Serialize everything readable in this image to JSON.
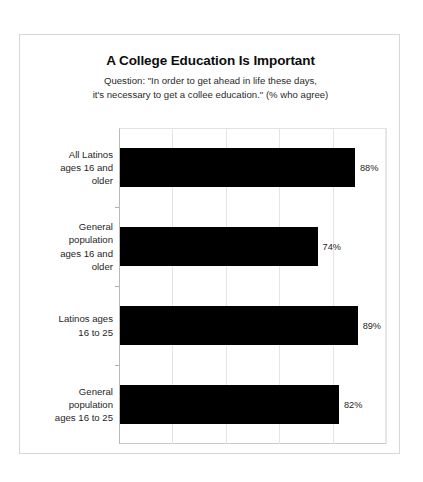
{
  "chart_data": {
    "type": "bar",
    "orientation": "horizontal",
    "title": "A College Education Is Important",
    "subtitle_lines": [
      "Question: \"In order to get ahead in life these days,",
      "it's necessary to get a collee education.\" (% who agree)"
    ],
    "xlabel": "",
    "ylabel": "",
    "xlim": [
      0,
      100
    ],
    "grid": true,
    "gridline_values": [
      20,
      40,
      60,
      80,
      100
    ],
    "legend": null,
    "value_suffix": "%",
    "categories": [
      "All Latinos ages 16 and older",
      "General population ages 16 and older",
      "Latinos ages 16 to 25",
      "General population ages 16 to 25"
    ],
    "category_label_lines": [
      [
        "All Latinos",
        "ages 16 and",
        "older"
      ],
      [
        "General",
        "population",
        "ages 16 and",
        "older"
      ],
      [
        "Latinos ages",
        "16 to 25"
      ],
      [
        "General",
        "population",
        "ages 16 to 25"
      ]
    ],
    "values": [
      88,
      74,
      89,
      82
    ],
    "value_labels": [
      "88%",
      "74%",
      "89%",
      "82%"
    ],
    "bar_color": "#000000",
    "background_color": "#ffffff"
  }
}
